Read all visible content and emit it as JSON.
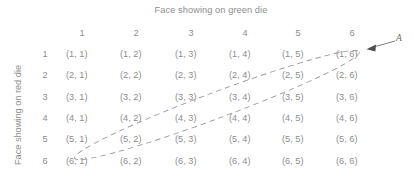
{
  "figure": {
    "column_axis_title": "Face showing on green die",
    "row_axis_title": "Face showing on red die",
    "column_headers": [
      "1",
      "2",
      "3",
      "4",
      "5",
      "6"
    ],
    "row_headers": [
      "1",
      "2",
      "3",
      "4",
      "5",
      "6"
    ],
    "cells": [
      [
        "(1, 1)",
        "(1, 2)",
        "(1, 3)",
        "(1, 4)",
        "(1, 5)",
        "(1, 6)"
      ],
      [
        "(2, 1)",
        "(2, 2)",
        "(2, 3)",
        "(2, 4)",
        "(2, 5)",
        "(2, 6)"
      ],
      [
        "(3, 1)",
        "(3, 2)",
        "(3, 3)",
        "(3, 4)",
        "(3, 5)",
        "(3, 6)"
      ],
      [
        "(4, 1)",
        "(4, 2)",
        "(4, 3)",
        "(4, 4)",
        "(4, 5)",
        "(4, 6)"
      ],
      [
        "(5, 1)",
        "(5, 2)",
        "(5, 3)",
        "(5, 4)",
        "(5, 5)",
        "(5, 6)"
      ],
      [
        "(6, 1)",
        "(6, 2)",
        "(6, 3)",
        "(6, 4)",
        "(6, 5)",
        "(6, 6)"
      ]
    ],
    "annotation": {
      "label": "A",
      "highlighted_cells": [
        "(6, 1)",
        "(5, 2)",
        "(4, 3)",
        "(3, 4)",
        "(2, 5)",
        "(1, 6)"
      ],
      "outline_style": "dashed-ellipse",
      "outline_color": "#9a9a9a",
      "arrow_color": "#6f6f6f"
    },
    "colors": {
      "background": "#ffffff",
      "text": "#8d8d8d",
      "label_text": "#6f6f6f"
    }
  }
}
